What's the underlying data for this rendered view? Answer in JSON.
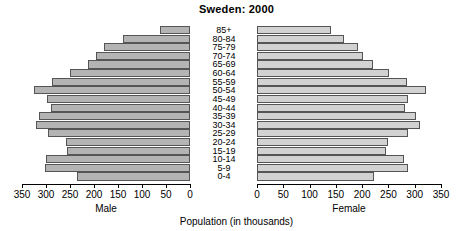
{
  "title": "Sweden: 2000",
  "xlabel": "Population (in thousands)",
  "male_caption": "Male",
  "female_caption": "Female",
  "axis": {
    "ticks": [
      0,
      50,
      100,
      150,
      200,
      250,
      300,
      350
    ],
    "tick_labels": [
      "0",
      "50",
      "100",
      "150",
      "200",
      "250",
      "300",
      "350"
    ],
    "max": 350
  },
  "colors": {
    "male_bar": "#b4b4b4",
    "female_bar": "#d2d2d2",
    "bar_border": "#555555",
    "axis": "#000000",
    "background": "#ffffff",
    "text": "#000000"
  },
  "chart_data": {
    "type": "bar",
    "subtype": "population-pyramid",
    "title": "Sweden: 2000",
    "xlabel": "Population (in thousands)",
    "ylabel": "",
    "xlim": [
      0,
      350
    ],
    "grid": false,
    "legend": "none",
    "orientation": "horizontal",
    "categories": [
      "0-4",
      "5-9",
      "10-14",
      "15-19",
      "20-24",
      "25-29",
      "30-34",
      "35-39",
      "40-44",
      "45-49",
      "50-54",
      "55-59",
      "60-64",
      "65-69",
      "70-74",
      "75-79",
      "80-84",
      "85+"
    ],
    "series": [
      {
        "name": "Male",
        "side": "left",
        "values": [
          236,
          302,
          300,
          257,
          258,
          295,
          320,
          315,
          290,
          298,
          325,
          287,
          250,
          213,
          196,
          180,
          140,
          62
        ]
      },
      {
        "name": "Female",
        "side": "right",
        "values": [
          223,
          288,
          280,
          245,
          249,
          288,
          310,
          303,
          282,
          288,
          321,
          285,
          252,
          220,
          202,
          193,
          165,
          140
        ]
      }
    ]
  }
}
